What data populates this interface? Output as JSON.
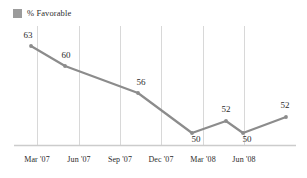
{
  "legend": {
    "swatch_icon": "legend-square-icon",
    "label": "% Favorable",
    "color": "#9b9b9b"
  },
  "chart_data": {
    "type": "line",
    "title": "",
    "subtitle": "",
    "xlabel": "",
    "ylabel": "",
    "grid": "vertical",
    "legend_position": "top-left",
    "line_color": "#8c8c8c",
    "marker_color": "#8c8c8c",
    "gridline_color": "#d8d8d8",
    "axis_color": "#cccccc",
    "categories": [
      "Mar '07",
      "Jun '07",
      "Sep '07",
      "Dec '07",
      "Mar '08",
      "Jun '08",
      ""
    ],
    "tick_labels": [
      "Mar '07",
      "Jun '07",
      "Sep '07",
      "Dec '07",
      "Mar '08",
      "Jun '08"
    ],
    "series": [
      {
        "name": "% Favorable",
        "values": [
          63,
          60,
          56,
          50,
          52,
          50,
          52
        ]
      }
    ],
    "point_labels": [
      "63",
      "60",
      "56",
      "50",
      "52",
      "50",
      "52"
    ],
    "ylim": [
      44,
      66
    ],
    "ylim_note": "no y-axis shown; values labeled directly on points"
  },
  "points": [
    {
      "label": "63",
      "x": 31,
      "y": 46,
      "lx": 28,
      "ly": 31,
      "label_align": "above-left"
    },
    {
      "label": "60",
      "x": 65,
      "y": 66,
      "lx": 66,
      "ly": 51,
      "label_align": "above-right"
    },
    {
      "label": "56",
      "x": 138,
      "y": 93,
      "lx": 141,
      "ly": 78,
      "label_align": "above-right"
    },
    {
      "label": "50",
      "x": 192,
      "y": 133,
      "lx": 196,
      "ly": 135,
      "label_align": "below"
    },
    {
      "label": "52",
      "x": 226,
      "y": 121,
      "lx": 226,
      "ly": 105,
      "label_align": "above"
    },
    {
      "label": "50",
      "x": 243,
      "y": 133,
      "lx": 247,
      "ly": 135,
      "label_align": "below"
    },
    {
      "label": "52",
      "x": 286,
      "y": 117,
      "lx": 285,
      "ly": 101,
      "label_align": "above"
    }
  ],
  "gridlines": [
    {
      "name": "gridline-mar-07",
      "x": 37
    },
    {
      "name": "gridline-jun-07",
      "x": 79
    },
    {
      "name": "gridline-sep-07",
      "x": 120
    },
    {
      "name": "gridline-dec-07",
      "x": 161
    },
    {
      "name": "gridline-mar-08",
      "x": 203
    },
    {
      "name": "gridline-jun-08",
      "x": 244
    }
  ],
  "xticks": [
    {
      "label": "Mar '07",
      "x": 37
    },
    {
      "label": "Jun '07",
      "x": 79
    },
    {
      "label": "Sep '07",
      "x": 120
    },
    {
      "label": "Dec '07",
      "x": 161
    },
    {
      "label": "Mar '08",
      "x": 203
    },
    {
      "label": "Jun '08",
      "x": 244
    }
  ]
}
